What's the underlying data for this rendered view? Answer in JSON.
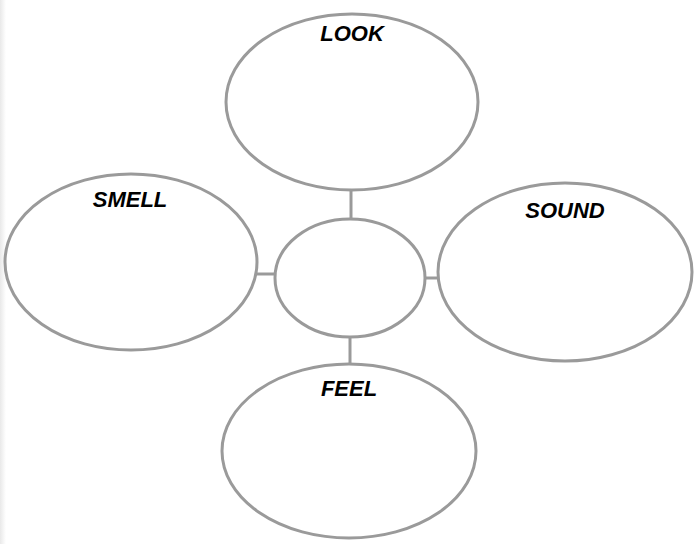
{
  "diagram": {
    "type": "sensory-web",
    "stroke_color": "#9a9a9a",
    "label_color": "#000000",
    "center": {
      "label": ""
    },
    "nodes": [
      {
        "id": "look",
        "label": "LOOK"
      },
      {
        "id": "smell",
        "label": "SMELL"
      },
      {
        "id": "sound",
        "label": "SOUND"
      },
      {
        "id": "feel",
        "label": "FEEL"
      }
    ]
  }
}
